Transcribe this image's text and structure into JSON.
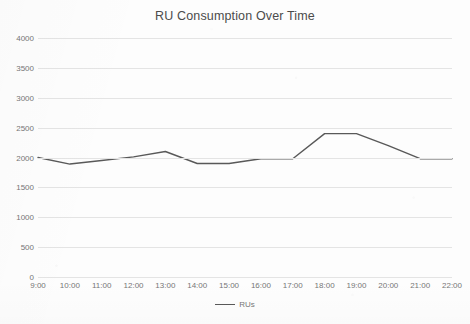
{
  "chart_data": {
    "type": "line",
    "title": "RU Consumption Over Time",
    "xlabel": "",
    "ylabel": "",
    "categories": [
      "9:00",
      "10:00",
      "11:00",
      "12:00",
      "13:00",
      "14:00",
      "15:00",
      "16:00",
      "17:00",
      "18:00",
      "19:00",
      "20:00",
      "21:00",
      "22:00"
    ],
    "series": [
      {
        "name": "RUs",
        "color": "#595959",
        "values": [
          2000,
          1890,
          1950,
          2010,
          2100,
          1900,
          1900,
          1980,
          1980,
          2400,
          2400,
          2200,
          1980,
          1980
        ]
      }
    ],
    "ylim": [
      0,
      4000
    ],
    "yticks": [
      0,
      500,
      1000,
      1500,
      2000,
      2500,
      3000,
      3500,
      4000
    ],
    "ytick_labels": [
      "0",
      "500",
      "1000",
      "1500",
      "2000",
      "2500",
      "3000",
      "3500",
      "4000"
    ],
    "grid": "horizontal",
    "legend_position": "bottom",
    "legend_entries": [
      "RUs"
    ]
  },
  "colors": {
    "line": "#595959",
    "grid": "#e4e4e4",
    "text": "#767676",
    "title": "#4b4b4b",
    "background": "#fdfdfd"
  }
}
